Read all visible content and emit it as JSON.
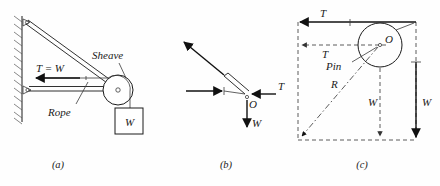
{
  "figure": {
    "background_color": "#fefefe",
    "ink_color": "#1a1a1a"
  },
  "panels": [
    {
      "key": "a",
      "caption": "(a)",
      "description": "Wall-mounted bracket with sheave carrying a hanging weight",
      "labels": {
        "tension": "T = W",
        "sheave": "Sheave",
        "rope": "Rope",
        "weight": "W"
      }
    },
    {
      "key": "b",
      "caption": "(b)",
      "description": "Free body diagram of the pin at O",
      "labels": {
        "tension": "T",
        "weight": "W",
        "point": "O"
      }
    },
    {
      "key": "c",
      "caption": "(c)",
      "description": "Force parallelogram giving resultant R on the pin",
      "labels": {
        "tension_top": "T",
        "tension_mid": "T",
        "pin": "Pin",
        "resultant": "R",
        "weight_inner": "W",
        "weight_outer": "W",
        "point": "O"
      }
    }
  ],
  "captions": {
    "a": "(a)",
    "b": "(b)",
    "c": "(c)"
  },
  "panel_a": {
    "tension_label": "T = W",
    "sheave_label": "Sheave",
    "rope_label": "Rope",
    "weight_label": "W"
  },
  "panel_b": {
    "tension_label": "T",
    "weight_label": "W",
    "origin_label": "O"
  },
  "panel_c": {
    "tension_top_label": "T",
    "tension_mid_label": "T",
    "pin_label": "Pin",
    "resultant_label": "R",
    "weight_inner_label": "W",
    "weight_outer_label": "W",
    "origin_label": "O"
  }
}
